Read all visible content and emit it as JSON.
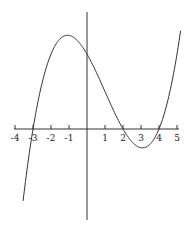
{
  "chart_data": {
    "type": "line",
    "title": "",
    "xlabel": "",
    "ylabel": "",
    "x_ticks": [
      -4,
      -3,
      -2,
      -1,
      1,
      2,
      3,
      4,
      5
    ],
    "x_tick_labels": [
      "-4",
      "-3",
      "-2",
      "-1",
      "1",
      "2",
      "3",
      "4",
      "5"
    ],
    "xlim": [
      -4.1,
      5.1
    ],
    "grid": false,
    "legend": null,
    "series": [
      {
        "name": "cubic",
        "description": "cubic polynomial with zeros at x=-3, x=2, x=4; local max near x=-1, local min near x=3.1",
        "roots": [
          -3,
          2,
          4
        ],
        "x": [
          -3.55,
          -3,
          -2.5,
          -2,
          -1.5,
          -1,
          -0.5,
          0,
          0.5,
          1,
          1.5,
          2,
          2.5,
          3,
          3.1,
          3.5,
          4,
          4.5,
          5,
          5.2
        ],
        "y": [
          -4.8,
          0,
          2.8,
          4.4,
          5.1,
          5.2,
          4.9,
          4.2,
          3.3,
          2.2,
          1.1,
          0,
          -0.9,
          -1.1,
          -1.1,
          -0.9,
          0,
          1.6,
          3.7,
          5.4
        ]
      }
    ],
    "color": "#333333"
  }
}
